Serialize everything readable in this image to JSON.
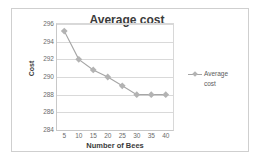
{
  "chart_data": {
    "type": "line",
    "title": "Average cost",
    "xlabel": "Number of Bees",
    "ylabel": "Cost",
    "x": [
      5,
      10,
      15,
      20,
      25,
      30,
      35,
      40
    ],
    "categories": [
      "5",
      "10",
      "15",
      "20",
      "25",
      "30",
      "35",
      "40"
    ],
    "series": [
      {
        "name": "Average cost",
        "values": [
          295.2,
          292.0,
          290.8,
          290.0,
          289.0,
          288.0,
          288.0,
          288.0
        ]
      }
    ],
    "ylim": [
      284,
      296
    ],
    "yticks": [
      284,
      286,
      288,
      290,
      292,
      294,
      296
    ],
    "ytick_labels": [
      "284",
      "286",
      "288",
      "290",
      "292",
      "294",
      "296"
    ],
    "grid": true,
    "legend_position": "right",
    "legend_entries": [
      "Average cost"
    ],
    "colors": {
      "series_line": "#a6a6a6",
      "marker": "#b3b3b3",
      "gridline": "#d9d9d9",
      "axis": "#c8c8c8",
      "title_text": "#3b3b3b",
      "tick_text": "#6b6b6b",
      "frame_border": "#cfcfcf",
      "background": "#ffffff"
    }
  },
  "legend": {
    "line1": "Average",
    "line2": "cost"
  }
}
